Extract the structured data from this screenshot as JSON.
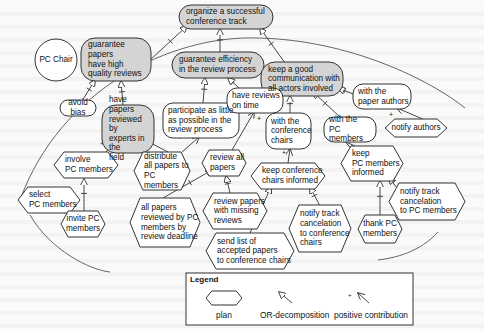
{
  "diagram": {
    "actor": {
      "label": "PC Chair",
      "cx": 56,
      "cy": 60,
      "r": 21
    },
    "boundary_arc": "M 20 200 C 60 90, 170 35, 258 38 C 350 40, 430 80, 465 108",
    "boundary_arc_lower": "M 30 215 C 50 250, 90 270, 110 272",
    "boundary_arc_right": "M 438 232 C 420 252, 395 258, 378 260",
    "colors": {
      "goal_fill": "#d4d4d4",
      "softgoal_fill": "#ffffff",
      "stroke": "#333333",
      "background": "#fafafa"
    },
    "goals": [
      {
        "id": "g_root",
        "label": "organize a successful\nconference track",
        "x": 179,
        "y": 5,
        "w": 94,
        "h": 24,
        "align": "left"
      },
      {
        "id": "g_quality",
        "label": "guarantee papers\nhave high\nquality reviews",
        "x": 81,
        "y": 38,
        "w": 70,
        "h": 43,
        "align": "left"
      },
      {
        "id": "g_efficiency",
        "label": "guarantee efficiency\nin the review process",
        "x": 172,
        "y": 52,
        "w": 92,
        "h": 26,
        "align": "left"
      },
      {
        "id": "g_comm",
        "label": "keep a good\ncommunication with\nall actors involved",
        "x": 261,
        "y": 62,
        "w": 82,
        "h": 34,
        "align": "left"
      },
      {
        "id": "g_experts",
        "label": "have papers\nreviewed by\nexperts in the\nfield",
        "x": 102,
        "y": 105,
        "w": 52,
        "h": 48,
        "align": "left"
      }
    ],
    "softgoals": [
      {
        "id": "s_bias",
        "label": "avoid bias",
        "x": 60,
        "y": 100,
        "w": 36,
        "h": 16,
        "align": "center"
      },
      {
        "id": "s_participate",
        "label": "participate as little\nas possible in the\nreview process",
        "x": 163,
        "y": 103,
        "w": 76,
        "h": 35,
        "align": "left"
      },
      {
        "id": "s_ontime",
        "label": "have reviews\non time",
        "x": 227,
        "y": 88,
        "w": 56,
        "h": 25,
        "align": "left"
      },
      {
        "id": "s_paperauthors",
        "label": "with the\npaper authors",
        "x": 353,
        "y": 84,
        "w": 58,
        "h": 25,
        "align": "left"
      },
      {
        "id": "s_confchairs",
        "label": "with the\nconference\nchairs",
        "x": 266,
        "y": 113,
        "w": 45,
        "h": 36,
        "align": "left"
      },
      {
        "id": "s_pcmembers",
        "label": "with the\nPC members",
        "x": 324,
        "y": 117,
        "w": 52,
        "h": 25,
        "align": "left"
      }
    ],
    "plans": [
      {
        "id": "p_involve",
        "label": "involve\nPC members",
        "x": 54,
        "y": 152,
        "w": 64,
        "h": 26,
        "align": "left"
      },
      {
        "id": "p_select",
        "label": "select\nPC members",
        "x": 18,
        "y": 187,
        "w": 62,
        "h": 26,
        "align": "left"
      },
      {
        "id": "p_invite",
        "label": "invite PC\nmembers",
        "x": 61,
        "y": 211,
        "w": 44,
        "h": 26,
        "align": "center"
      },
      {
        "id": "p_distribute",
        "label": "distribute\nall papers to\nPC members",
        "x": 134,
        "y": 152,
        "w": 56,
        "h": 38,
        "align": "left"
      },
      {
        "id": "p_review_all",
        "label": "review all\npapers",
        "x": 202,
        "y": 150,
        "w": 44,
        "h": 26,
        "align": "left"
      },
      {
        "id": "p_all_reviewed",
        "label": "all papers\nreviewed by PC\nmembers by\nreview deadline",
        "x": 130,
        "y": 198,
        "w": 70,
        "h": 49,
        "align": "left"
      },
      {
        "id": "p_missing",
        "label": "review papers\nwith missing\nreviews",
        "x": 203,
        "y": 193,
        "w": 64,
        "h": 36,
        "align": "left"
      },
      {
        "id": "p_keep_conf",
        "label": "keep conference\nchairs informed",
        "x": 251,
        "y": 163,
        "w": 74,
        "h": 26,
        "align": "left"
      },
      {
        "id": "p_notify_authors",
        "label": "notify authors",
        "x": 385,
        "y": 119,
        "w": 62,
        "h": 18,
        "align": "center"
      },
      {
        "id": "p_keep_pc",
        "label": "keep\nPC members\ninformed",
        "x": 341,
        "y": 146,
        "w": 62,
        "h": 35,
        "align": "left"
      },
      {
        "id": "p_send_list",
        "label": "send list of\naccepted papers\nto conference chairs",
        "x": 206,
        "y": 233,
        "w": 88,
        "h": 36,
        "align": "left"
      },
      {
        "id": "p_notify_conf",
        "label": "notify track\ncancelation\nto conference\nchairs",
        "x": 289,
        "y": 205,
        "w": 62,
        "h": 47,
        "align": "left"
      },
      {
        "id": "p_thank",
        "label": "thank PC\nmembers",
        "x": 358,
        "y": 215,
        "w": 44,
        "h": 28,
        "align": "center"
      },
      {
        "id": "p_notify_pc",
        "label": "notify track\ncancelation\nto PC members",
        "x": 389,
        "y": 183,
        "w": 76,
        "h": 37,
        "align": "left"
      }
    ],
    "or_links": [
      {
        "from": [
          150,
          60
        ],
        "to": [
          187,
          26
        ]
      },
      {
        "from": [
          220,
          53
        ],
        "to": [
          220,
          29
        ]
      },
      {
        "from": [
          285,
          63
        ],
        "to": [
          260,
          28
        ]
      },
      {
        "from": [
          82,
          101
        ],
        "to": [
          95,
          80
        ]
      },
      {
        "from": [
          123,
          105
        ],
        "to": [
          121,
          81
        ]
      },
      {
        "from": [
          203,
          103
        ],
        "to": [
          205,
          78
        ]
      },
      {
        "from": [
          239,
          88
        ],
        "to": [
          228,
          78
        ]
      },
      {
        "from": [
          290,
          113
        ],
        "to": [
          290,
          96
        ]
      },
      {
        "from": [
          340,
          117
        ],
        "to": [
          313,
          92
        ]
      },
      {
        "from": [
          353,
          94
        ],
        "to": [
          338,
          88
        ]
      },
      {
        "from": [
          71,
          178
        ],
        "to": [
          80,
          168
        ]
      },
      {
        "from": [
          84,
          211
        ],
        "to": [
          84,
          179
        ]
      },
      {
        "from": [
          163,
          198
        ],
        "to": [
          212,
          170
        ]
      },
      {
        "from": [
          230,
          193
        ],
        "to": [
          226,
          176
        ]
      },
      {
        "from": [
          250,
          233
        ],
        "to": [
          271,
          187
        ]
      },
      {
        "from": [
          320,
          206
        ],
        "to": [
          310,
          187
        ]
      },
      {
        "from": [
          380,
          215
        ],
        "to": [
          380,
          181
        ]
      },
      {
        "from": [
          397,
          188
        ],
        "to": [
          389,
          178
        ]
      }
    ],
    "contrib_links": [
      {
        "from": [
          106,
          152
        ],
        "to": [
          118,
          139
        ],
        "plus": [
          100,
          146
        ]
      },
      {
        "from": [
          168,
          152
        ],
        "to": [
          143,
          139
        ],
        "plus": [
          138,
          146
        ]
      },
      {
        "from": [
          182,
          152
        ],
        "to": [
          199,
          137
        ],
        "plus": [
          178,
          140
        ]
      },
      {
        "from": [
          232,
          150
        ],
        "to": [
          254,
          112
        ],
        "plus": [
          257,
          121
        ]
      },
      {
        "from": [
          288,
          163
        ],
        "to": [
          290,
          149
        ],
        "plus": [
          282,
          155
        ]
      },
      {
        "from": [
          355,
          146
        ],
        "to": [
          346,
          142
        ],
        "plus": [
          350,
          150
        ]
      },
      {
        "from": [
          425,
          120
        ],
        "to": [
          397,
          108
        ],
        "plus": [
          389,
          117
        ]
      }
    ],
    "ghost_lines": [
      [
        14,
        302
      ],
      [
        54,
        200
      ],
      [
        94,
        236
      ],
      [
        134,
        250
      ],
      [
        176,
        214
      ],
      [
        300,
        228
      ],
      [
        320,
        258
      ],
      [
        316,
        248
      ]
    ]
  },
  "legend": {
    "title": "Legend",
    "items": [
      {
        "label": "plan"
      },
      {
        "label": "OR-decomposition"
      },
      {
        "label": "positive contribution"
      }
    ],
    "box": {
      "x": 186,
      "y": 273,
      "w": 227,
      "h": 52
    }
  }
}
